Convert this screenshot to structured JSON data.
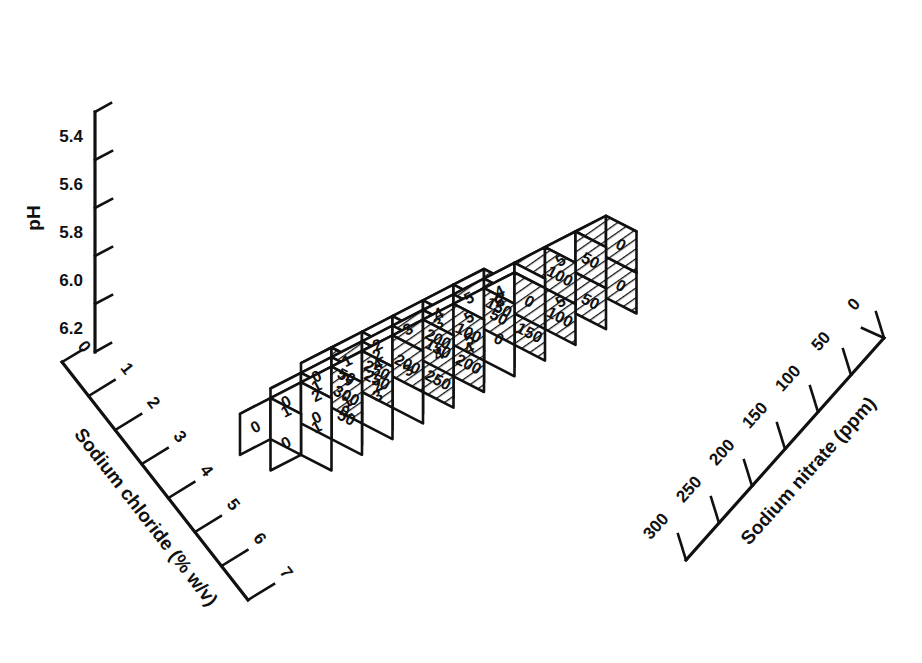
{
  "figure": {
    "type": "isometric-block-diagram"
  },
  "axes": {
    "vertical": {
      "name": "pH",
      "ticks": [
        "5.4",
        "5.6",
        "5.8",
        "6.0",
        "6.2"
      ],
      "origin_label": "0"
    },
    "left": {
      "name": "Sodium chloride (% w/v)",
      "ticks": [
        "0",
        "1",
        "2",
        "3",
        "4",
        "5",
        "6",
        "7"
      ]
    },
    "right": {
      "name": "Sodium nitrate (ppm)",
      "ticks": [
        "300",
        "250",
        "200",
        "150",
        "100",
        "50",
        "0"
      ]
    }
  },
  "chart_data": {
    "type": "table",
    "title": "",
    "xlabel": "Sodium chloride (% w/v)",
    "ylabel": "pH",
    "zlabel": "Sodium nitrate (ppm)",
    "left_face_values": [
      "0",
      "0",
      "0",
      "0",
      "1",
      "1",
      "1",
      "2",
      "2",
      "3",
      "3",
      "4",
      "4",
      "5",
      "5",
      "5",
      "6",
      "1",
      "2",
      "3",
      "4",
      "5"
    ],
    "right_face_values": [
      "50",
      "50",
      "300",
      "250",
      "250",
      "250",
      "200",
      "200",
      "200",
      "150",
      "150",
      "150",
      "100",
      "100",
      "100",
      "50",
      "50",
      "50",
      "0",
      "0",
      "0",
      "0"
    ]
  },
  "cubes": [
    {
      "i": 0,
      "j": 6,
      "k": 2,
      "left": "0",
      "right": "50"
    },
    {
      "i": 0,
      "j": 6,
      "k": 1,
      "left": "0",
      "right": "50"
    },
    {
      "i": 1,
      "j": 6,
      "k": 2,
      "left": "1",
      "right": ""
    },
    {
      "i": 1,
      "j": 6,
      "k": 1,
      "left": "1",
      "right": ""
    },
    {
      "i": 2,
      "j": 6,
      "k": 2,
      "left": "2",
      "right": ""
    },
    {
      "i": 2,
      "j": 6,
      "k": 1,
      "left": "2",
      "right": ""
    },
    {
      "i": 3,
      "j": 6,
      "k": 2,
      "left": "3",
      "right": ""
    },
    {
      "i": 3,
      "j": 6,
      "k": 1,
      "left": "3",
      "right": ""
    },
    {
      "i": 4,
      "j": 6,
      "k": 2,
      "left": "4",
      "right": ""
    },
    {
      "i": 4,
      "j": 6,
      "k": 1,
      "left": "4",
      "right": ""
    },
    {
      "i": 5,
      "j": 6,
      "k": 2,
      "left": "5",
      "right": "0"
    },
    {
      "i": 5,
      "j": 6,
      "k": 1,
      "left": "5",
      "right": "0"
    },
    {
      "i": 0,
      "j": 5,
      "k": 1,
      "left": "0",
      "right": ""
    },
    {
      "i": 0,
      "j": 5,
      "k": 0,
      "left": "0",
      "right": ""
    },
    {
      "i": 1,
      "j": 5,
      "k": 1,
      "left": "1",
      "right": ""
    },
    {
      "i": 1,
      "j": 5,
      "k": 0,
      "left": "1",
      "right": ""
    },
    {
      "i": 2,
      "j": 5,
      "k": 1,
      "left": "",
      "right": "250"
    },
    {
      "i": 2,
      "j": 5,
      "k": 0,
      "left": "2",
      "right": ""
    },
    {
      "i": 3,
      "j": 5,
      "k": 1,
      "left": "2",
      "right": ""
    },
    {
      "i": 3,
      "j": 5,
      "k": 0,
      "left": "3",
      "right": ""
    },
    {
      "i": 4,
      "j": 5,
      "k": 1,
      "left": "",
      "right": "200"
    },
    {
      "i": 4,
      "j": 5,
      "k": 0,
      "left": "",
      "right": "250"
    },
    {
      "i": 5,
      "j": 5,
      "k": 1,
      "left": "3",
      "right": ""
    },
    {
      "i": 5,
      "j": 5,
      "k": 0,
      "left": "",
      "right": "200"
    },
    {
      "i": 6,
      "j": 5,
      "k": 1,
      "left": "",
      "right": "150"
    },
    {
      "i": 6,
      "j": 5,
      "k": 0,
      "left": "4",
      "right": ""
    },
    {
      "i": 7,
      "j": 5,
      "k": 1,
      "left": "4",
      "right": ""
    },
    {
      "i": 7,
      "j": 5,
      "k": 0,
      "left": "",
      "right": "150"
    },
    {
      "i": 8,
      "j": 5,
      "k": 1,
      "left": "",
      "right": "100"
    },
    {
      "i": 8,
      "j": 5,
      "k": 0,
      "left": "",
      "right": "100"
    },
    {
      "i": 9,
      "j": 5,
      "k": 1,
      "left": "5",
      "right": "50"
    },
    {
      "i": 9,
      "j": 5,
      "k": 0,
      "left": "5",
      "right": "50"
    },
    {
      "i": 10,
      "j": 5,
      "k": 1,
      "left": "",
      "right": "0"
    },
    {
      "i": 10,
      "j": 5,
      "k": 0,
      "left": "",
      "right": "0"
    },
    {
      "i": 0,
      "j": 4,
      "k": 0,
      "left": "0",
      "right": ""
    },
    {
      "i": 1,
      "j": 4,
      "k": 0,
      "left": "1",
      "right": ""
    },
    {
      "i": 2,
      "j": 4,
      "k": 0,
      "left": "2",
      "right": "300"
    },
    {
      "i": 3,
      "j": 4,
      "k": 0,
      "left": "3",
      "right": "250"
    },
    {
      "i": 4,
      "j": 4,
      "k": 0,
      "left": "4",
      "right": "200"
    },
    {
      "i": 5,
      "j": 4,
      "k": 0,
      "left": "",
      "right": "150"
    },
    {
      "i": 6,
      "j": 4,
      "k": 0,
      "left": "",
      "right": "100"
    },
    {
      "i": 7,
      "j": 4,
      "k": 0,
      "left": "5",
      "right": "50"
    },
    {
      "i": 8,
      "j": 4,
      "k": 0,
      "left": "6",
      "right": "0"
    }
  ]
}
